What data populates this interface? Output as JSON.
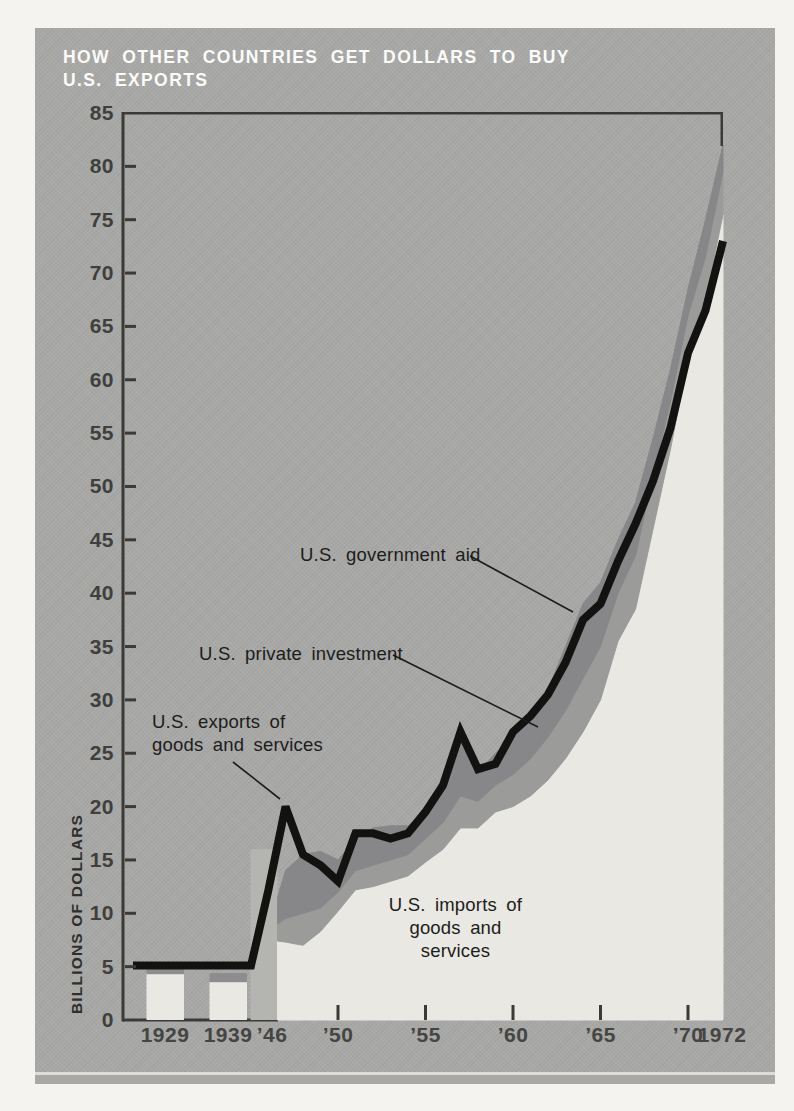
{
  "title": {
    "line1": "HOW OTHER COUNTRIES GET DOLLARS TO BUY",
    "line2": "U.S. EXPORTS"
  },
  "y_axis": {
    "label": "BILLIONS OF DOLLARS",
    "tick_values": [
      0,
      5,
      10,
      15,
      20,
      25,
      30,
      35,
      40,
      45,
      50,
      55,
      60,
      65,
      70,
      75,
      80,
      85
    ]
  },
  "x_axis": {
    "labels": [
      "1929",
      "1939",
      "’46",
      "’50",
      "’55",
      "’60",
      "’65",
      "’70",
      "1972"
    ]
  },
  "annotations": {
    "government_aid": "U.S. government aid",
    "private_investment": "U.S. private investment",
    "exports_line1": "U.S. exports of",
    "exports_line2": "goods and services",
    "imports_line1": "U.S. imports of",
    "imports_line2": "goods and services"
  },
  "chart_data": {
    "type": "area",
    "title": "HOW OTHER COUNTRIES GET DOLLARS TO BUY U.S. EXPORTS",
    "ylabel": "BILLIONS OF DOLLARS",
    "ylim": [
      0,
      85
    ],
    "y_tick_step": 5,
    "grid": false,
    "legend": "inline-callout-labels",
    "x_tick_years": [
      1950,
      1955,
      1960,
      1965,
      1970
    ],
    "early_bars": [
      {
        "year": 1929,
        "imports_top": 4.3,
        "aid_band_bottom": 4.3,
        "aid_band_top": 4.95,
        "exports_line_level": 5.1
      },
      {
        "year": 1939,
        "imports_top": 3.55,
        "aid_band_bottom": 3.55,
        "aid_band_top": 4.4,
        "exports_line_level": 5.1
      }
    ],
    "transition_bar_1946_top": 16,
    "exports_flat_level_pre1945": 5.1,
    "stack_years": [
      1946.55,
      1947,
      1948,
      1949,
      1950,
      1951,
      1952,
      1953,
      1954,
      1955,
      1956,
      1957,
      1958,
      1959,
      1960,
      1961,
      1962,
      1963,
      1964,
      1965,
      1966,
      1967,
      1968,
      1969,
      1970,
      1971,
      1972
    ],
    "series": [
      {
        "name": "U.S. imports of goods and services",
        "values": [
          7.4,
          7.3,
          7.0,
          8.3,
          10.2,
          12.2,
          12.5,
          13.0,
          13.5,
          14.8,
          16.0,
          18.0,
          18.0,
          19.5,
          20.0,
          21.0,
          22.5,
          24.5,
          27.0,
          30.0,
          35.5,
          38.5,
          46.0,
          53.5,
          62.0,
          67.5,
          75.5
        ]
      },
      {
        "name": "U.S. private investment (cumulative top: imports + investment)",
        "values": [
          9.0,
          9.5,
          10.0,
          10.5,
          12.0,
          14.0,
          14.5,
          15.0,
          15.5,
          17.0,
          18.5,
          21.0,
          20.5,
          22.0,
          23.0,
          24.5,
          26.5,
          29.0,
          32.0,
          35.0,
          40.0,
          43.5,
          51.0,
          58.0,
          66.0,
          71.5,
          79.5
        ]
      },
      {
        "name": "U.S. government aid (cumulative top of stack)",
        "values": [
          11.5,
          14.0,
          15.5,
          15.8,
          15.0,
          17.0,
          18.0,
          18.2,
          18.2,
          19.5,
          21.5,
          26.3,
          23.2,
          25.0,
          26.5,
          28.0,
          31.0,
          35.0,
          39.0,
          41.0,
          45.0,
          48.5,
          54.5,
          61.0,
          68.5,
          75.0,
          82.0
        ]
      }
    ],
    "exports_line": {
      "name": "U.S. exports of goods and services",
      "years": [
        1946,
        1947,
        1948,
        1949,
        1950,
        1951,
        1952,
        1953,
        1954,
        1955,
        1956,
        1957,
        1958,
        1959,
        1960,
        1961,
        1962,
        1963,
        1964,
        1965,
        1966,
        1967,
        1968,
        1969,
        1970,
        1971,
        1972
      ],
      "values": [
        12,
        20,
        15.5,
        14.5,
        13,
        17.5,
        17.5,
        17,
        17.5,
        19.5,
        22,
        27,
        23.5,
        24,
        27,
        28.5,
        30.5,
        33.5,
        37.5,
        39,
        43,
        46.5,
        50.5,
        55.5,
        62.5,
        66.5,
        73
      ]
    },
    "colors": {
      "panel_background": "#a8a8a6",
      "imports_area": "#eae8e2",
      "investment_band": "#9b9b99",
      "aid_band": "#87878a",
      "exports_line": "#121210",
      "transition_bar": "#b4b4b1",
      "bar_cap": "#8d8d8f",
      "axis_frame": "#3a3a38",
      "axis_numerals": "#424240",
      "title_text": "#fbfbf9",
      "annotation_text": "#1c1c1a"
    }
  }
}
